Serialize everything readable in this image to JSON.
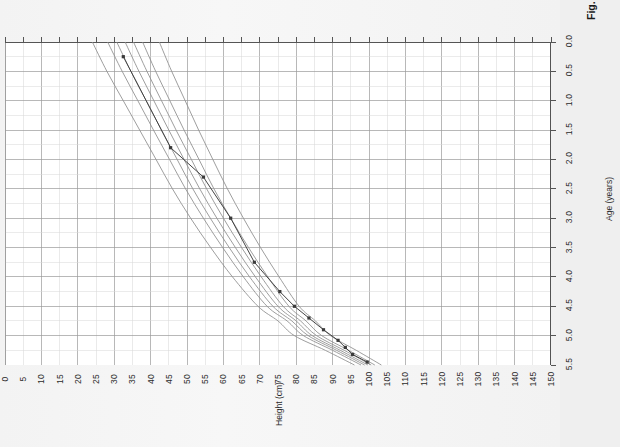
{
  "figure": {
    "caption_label": "Fig. 2.55",
    "caption_text": "Failure to grow secondary to neglect and non-accidental injury, showing",
    "orientation": "rotated-90-ccw",
    "page_background": "#efefef",
    "paper_background": "#f5f5f5"
  },
  "chart_data": {
    "type": "line",
    "title": "",
    "subtitle": "",
    "xlabel": "Age (years)",
    "ylabel": "Height (cm)",
    "xlim": [
      0.0,
      5.5
    ],
    "ylim": [
      0,
      150
    ],
    "xtick_step": 0.5,
    "ytick_step": 5,
    "xticks": [
      "0.0",
      "0.5",
      "1.0",
      "1.5",
      "2.0",
      "2.5",
      "3.0",
      "3.5",
      "4.0",
      "4.5",
      "5.0",
      "5.5"
    ],
    "yticks": [
      "0",
      "5",
      "10",
      "15",
      "20",
      "25",
      "30",
      "35",
      "40",
      "45",
      "50",
      "55",
      "60",
      "65",
      "70",
      "75",
      "80",
      "85",
      "90",
      "95",
      "100",
      "105",
      "110",
      "115",
      "120",
      "125",
      "130",
      "135",
      "140",
      "145",
      "150"
    ],
    "grid": true,
    "grid_major_color": "#9a9a9a",
    "grid_minor_color": "#d8d8d8",
    "axis_color": "#555555",
    "legend": "none",
    "centile_color": "#8c8c8c",
    "patient_color": "#3a3a3a",
    "series": [
      {
        "name": "99.6th centile",
        "kind": "centile",
        "x": [
          0.0,
          0.25,
          0.5,
          0.75,
          1.0,
          1.5,
          2.0,
          2.5,
          3.0,
          3.5,
          4.0,
          4.5,
          5.0,
          5.5
        ],
        "values": [
          54.0,
          62.0,
          70.5,
          75.0,
          80.5,
          87.5,
          93.5,
          99.0,
          104.0,
          108.5,
          113.0,
          117.5,
          122.0,
          126.0
        ]
      },
      {
        "name": "91st centile",
        "kind": "centile",
        "x": [
          0.0,
          0.25,
          0.5,
          0.75,
          1.0,
          1.5,
          2.0,
          2.5,
          3.0,
          3.5,
          4.0,
          4.5,
          5.0,
          5.5
        ],
        "values": [
          52.2,
          60.0,
          68.0,
          72.5,
          78.0,
          84.5,
          90.2,
          95.5,
          100.4,
          104.8,
          109.2,
          113.5,
          117.8,
          121.8
        ]
      },
      {
        "name": "75th centile",
        "kind": "centile",
        "x": [
          0.0,
          0.25,
          0.5,
          0.75,
          1.0,
          1.5,
          2.0,
          2.5,
          3.0,
          3.5,
          4.0,
          4.5,
          5.0,
          5.5
        ],
        "values": [
          51.2,
          58.9,
          66.7,
          71.2,
          76.4,
          82.8,
          88.4,
          93.6,
          98.4,
          102.7,
          107.0,
          111.2,
          115.4,
          119.3
        ]
      },
      {
        "name": "50th centile",
        "kind": "centile",
        "x": [
          0.0,
          0.25,
          0.5,
          0.75,
          1.0,
          1.5,
          2.0,
          2.5,
          3.0,
          3.5,
          4.0,
          4.5,
          5.0,
          5.5
        ],
        "values": [
          50.3,
          57.9,
          65.6,
          70.0,
          75.0,
          81.2,
          86.7,
          91.8,
          96.5,
          100.8,
          105.0,
          109.1,
          113.2,
          117.0
        ]
      },
      {
        "name": "25th centile",
        "kind": "centile",
        "x": [
          0.0,
          0.25,
          0.5,
          0.75,
          1.0,
          1.5,
          2.0,
          2.5,
          3.0,
          3.5,
          4.0,
          4.5,
          5.0,
          5.5
        ],
        "values": [
          49.4,
          56.8,
          64.4,
          68.8,
          73.6,
          79.6,
          85.0,
          90.0,
          94.6,
          98.8,
          103.0,
          107.0,
          111.0,
          114.7
        ]
      },
      {
        "name": "9th centile",
        "kind": "centile",
        "x": [
          0.0,
          0.25,
          0.5,
          0.75,
          1.0,
          1.5,
          2.0,
          2.5,
          3.0,
          3.5,
          4.0,
          4.5,
          5.0,
          5.5
        ],
        "values": [
          48.4,
          55.6,
          63.0,
          67.3,
          72.0,
          77.8,
          83.1,
          88.0,
          92.6,
          96.7,
          100.8,
          104.7,
          108.6,
          112.2
        ]
      },
      {
        "name": "0.4th centile",
        "kind": "centile",
        "x": [
          0.0,
          0.25,
          0.5,
          0.75,
          1.0,
          1.5,
          2.0,
          2.5,
          3.0,
          3.5,
          4.0,
          4.5,
          5.0,
          5.5
        ],
        "values": [
          46.6,
          53.5,
          60.6,
          64.7,
          69.2,
          74.7,
          79.8,
          84.5,
          88.9,
          92.9,
          96.8,
          100.5,
          104.2,
          107.6
        ]
      },
      {
        "name": "Patient height measurements",
        "kind": "patient",
        "marker": "square",
        "x": [
          0.05,
          0.18,
          0.3,
          0.42,
          0.6,
          0.8,
          1.0,
          1.25,
          1.75,
          2.5,
          3.2,
          3.7,
          5.25
        ],
        "values": [
          50.5,
          54.5,
          56.5,
          58.5,
          62.5,
          66.5,
          70.5,
          74.5,
          81.5,
          88.0,
          95.5,
          104.5,
          117.5
        ]
      }
    ],
    "annotations": []
  }
}
